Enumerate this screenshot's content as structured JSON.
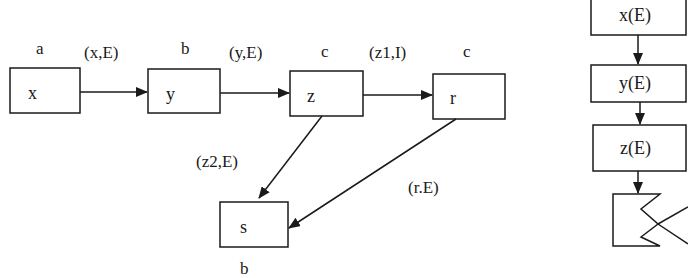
{
  "left_graph": {
    "nodes": [
      {
        "id": "x",
        "label": "x",
        "annotation": "a"
      },
      {
        "id": "y",
        "label": "y",
        "annotation": "b"
      },
      {
        "id": "z",
        "label": "z",
        "annotation": "c"
      },
      {
        "id": "r",
        "label": "r",
        "annotation": "c"
      },
      {
        "id": "s",
        "label": "s",
        "annotation": "b"
      }
    ],
    "edges": [
      {
        "from": "x",
        "to": "y",
        "label": "(x,E)"
      },
      {
        "from": "y",
        "to": "z",
        "label": "(y,E)"
      },
      {
        "from": "z",
        "to": "r",
        "label": "(z1,I)"
      },
      {
        "from": "z",
        "to": "s",
        "label": "(z2,E)"
      },
      {
        "from": "r",
        "to": "s",
        "label": "(r.E)"
      }
    ]
  },
  "right_stack": {
    "items": [
      {
        "label": "x(E)"
      },
      {
        "label": "y(E)"
      },
      {
        "label": "z(E)"
      },
      {
        "label": "",
        "shape": "notched-merge"
      }
    ]
  }
}
